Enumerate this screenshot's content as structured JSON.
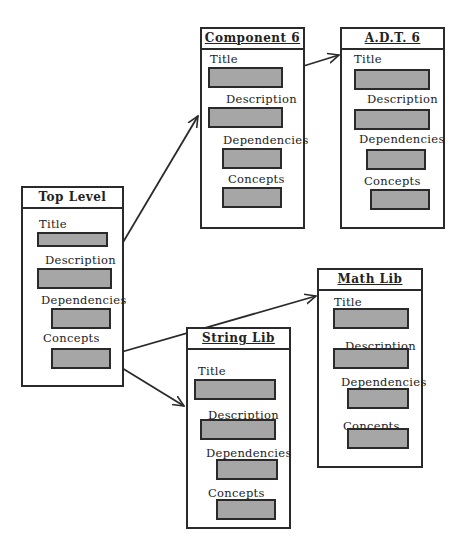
{
  "diagram": {
    "nodes": [
      {
        "id": "component6",
        "title": "Component 6",
        "fields": {
          "title": "Title",
          "description": "Description",
          "dependencies": "Dependencies",
          "concepts": "Concepts"
        }
      },
      {
        "id": "adt6",
        "title": "A.D.T. 6",
        "fields": {
          "title": "Title",
          "description": "Description",
          "dependencies": "Dependencies",
          "concepts": "Concepts"
        }
      },
      {
        "id": "top_level",
        "title": "Top Level",
        "fields": {
          "title": "Title",
          "description": "Description",
          "dependencies": "Dependencies",
          "concepts": "Concepts"
        }
      },
      {
        "id": "math_lib",
        "title": "Math Lib",
        "fields": {
          "title": "Title",
          "description": "Description",
          "dependencies": "Dependencies",
          "concepts": "Concepts"
        }
      },
      {
        "id": "string_lib",
        "title": "String Lib",
        "fields": {
          "title": "Title",
          "description": "Description",
          "dependencies": "Dependencies",
          "concepts": "Concepts"
        }
      }
    ],
    "edges": [
      {
        "from": "top_level.description",
        "to": "component6"
      },
      {
        "from": "component6.title",
        "to": "adt6"
      },
      {
        "from": "top_level.concepts",
        "to": "math_lib"
      },
      {
        "from": "top_level.concepts",
        "to": "string_lib"
      }
    ],
    "colors": {
      "border": "#2a2a2a",
      "field_fill": "#a6a6a6",
      "background": "#ffffff"
    }
  }
}
